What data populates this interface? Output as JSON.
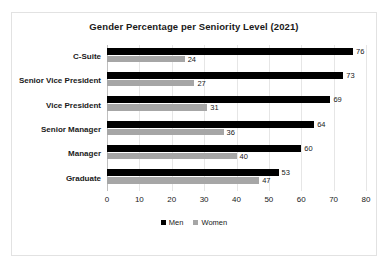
{
  "chart_data": {
    "type": "bar",
    "orientation": "horizontal",
    "title": "Gender Percentage per Seniority Level (2021)",
    "xlabel": "",
    "ylabel": "",
    "categories": [
      "C-Suite",
      "Senior Vice President",
      "Vice President",
      "Senior Manager",
      "Manager",
      "Graduate"
    ],
    "series": [
      {
        "name": "Men",
        "color": "#000000",
        "values": [
          76,
          73,
          69,
          64,
          60,
          53
        ]
      },
      {
        "name": "Women",
        "color": "#a6a6a6",
        "values": [
          24,
          27,
          31,
          36,
          40,
          47
        ]
      }
    ],
    "xlim": [
      0,
      80
    ],
    "xticks": [
      0,
      10,
      20,
      30,
      40,
      50,
      60,
      70,
      80
    ],
    "xtick_labels": [
      "0",
      "10",
      "20",
      "30",
      "40",
      "50",
      "60",
      "70",
      "80"
    ],
    "grid": true,
    "grid_axis": "x",
    "data_labels": true,
    "legend": {
      "position": "bottom",
      "entries": [
        "Men",
        "Women"
      ]
    }
  },
  "colors": {
    "men": "#000000",
    "women": "#a6a6a6",
    "gridline": "#e6e6e6",
    "axis": "#bfbfbf",
    "border": "#e2e2e2",
    "text": "#202020"
  }
}
